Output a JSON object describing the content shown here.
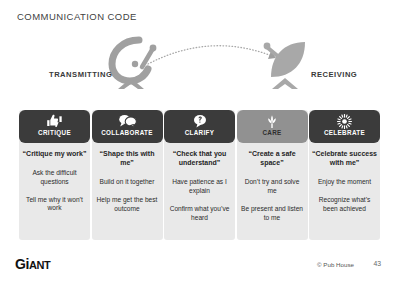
{
  "slide": {
    "title": "COMMUNICATION CODE"
  },
  "diagram": {
    "transmitting_label": "TRANSMITTING",
    "receiving_label": "RECEIVING",
    "transmit_icon": "satellite-dish-transmitting-icon",
    "receive_icon": "satellite-dish-receiving-icon",
    "signal_icon": "dotted-signal-arc-arrow"
  },
  "cards": [
    {
      "title": "CRITIQUE",
      "icon": "thumbs-up-down-icon",
      "quote": "“Critique my work”",
      "lines": [
        "Ask the difficult questions",
        "Tell me why it won’t work"
      ],
      "style": "dark"
    },
    {
      "title": "COLLABORATE",
      "icon": "speech-bubbles-icon",
      "quote": "“Shape this with me”",
      "lines": [
        "Build on it together",
        "Help me get the best outcome"
      ],
      "style": "dark"
    },
    {
      "title": "CLARIFY",
      "icon": "question-bubble-icon",
      "quote": "“Check that you understand”",
      "lines": [
        "Have patience as I explain",
        "Confirm what you’ve heard"
      ],
      "style": "dark"
    },
    {
      "title": "CARE",
      "icon": "sprout-plant-icon",
      "quote": "“Create a safe space”",
      "lines": [
        "Don’t try and solve me",
        "Be present and listen to me"
      ],
      "style": "light"
    },
    {
      "title": "CELEBRATE",
      "icon": "starburst-icon",
      "quote": "“Celebrate success with me”",
      "lines": [
        "Enjoy the moment",
        "Recognize what’s been achieved"
      ],
      "style": "dark"
    }
  ],
  "footer": {
    "brand_upper": "Gi",
    "brand_lower": "ANT",
    "copyright": "© Pub House",
    "page_number": "43"
  },
  "colors": {
    "header_dark": "#3b3b3b",
    "header_light": "#919191",
    "card_body": "#e9e9e9",
    "icon_grey": "#9a9a9a",
    "text_dark": "#2b2b2b"
  }
}
